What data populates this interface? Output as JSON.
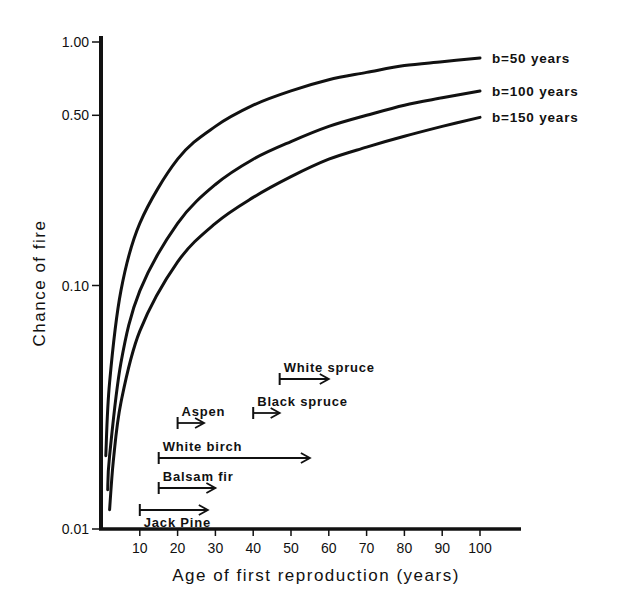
{
  "chart_data": {
    "type": "line",
    "title": "",
    "xlabel": "Age of first reproduction (years)",
    "ylabel": "Chance of fire",
    "xlim": [
      0,
      110
    ],
    "ylim": [
      0.01,
      1.0
    ],
    "yscale": "log",
    "grid": false,
    "legend_position": "inline-right",
    "x_ticks": [
      10,
      20,
      30,
      40,
      50,
      60,
      70,
      80,
      90,
      100
    ],
    "x_tick_labels": [
      "10",
      "20",
      "30",
      "40",
      "50",
      "60",
      "70",
      "80",
      "90",
      "100"
    ],
    "y_ticks": [
      0.01,
      0.1,
      0.5,
      1.0
    ],
    "y_tick_labels": [
      "0.01",
      "0.10",
      "0.50",
      "1.00"
    ],
    "series": [
      {
        "name": "b=50 years",
        "label": "b=50 years",
        "b": 50,
        "x": [
          1,
          2,
          5,
          10,
          20,
          30,
          40,
          50,
          60,
          70,
          80,
          90,
          100
        ],
        "values": [
          0.02,
          0.04,
          0.095,
          0.18,
          0.33,
          0.45,
          0.55,
          0.63,
          0.7,
          0.75,
          0.8,
          0.83,
          0.86
        ]
      },
      {
        "name": "b=100 years",
        "label": "b=100 years",
        "b": 100,
        "x": [
          1.5,
          2,
          5,
          10,
          20,
          30,
          40,
          50,
          60,
          70,
          80,
          90,
          100
        ],
        "values": [
          0.0145,
          0.02,
          0.048,
          0.095,
          0.18,
          0.26,
          0.33,
          0.39,
          0.45,
          0.5,
          0.55,
          0.59,
          0.63
        ]
      },
      {
        "name": "b=150 years",
        "label": "b=150 years",
        "b": 150,
        "x": [
          2,
          3,
          5,
          10,
          20,
          30,
          40,
          50,
          60,
          70,
          80,
          90,
          100
        ],
        "values": [
          0.012,
          0.019,
          0.033,
          0.065,
          0.125,
          0.18,
          0.23,
          0.28,
          0.33,
          0.37,
          0.41,
          0.45,
          0.49
        ]
      }
    ],
    "annotations": [
      {
        "species": "Jack Pine",
        "start_age": 10,
        "end_age": 28,
        "label_position": "below"
      },
      {
        "species": "Balsam fir",
        "start_age": 15,
        "end_age": 30,
        "label_position": "above"
      },
      {
        "species": "White birch",
        "start_age": 15,
        "end_age": 55,
        "label_position": "above"
      },
      {
        "species": "Aspen",
        "start_age": 20,
        "end_age": 27,
        "label_position": "above"
      },
      {
        "species": "Black spruce",
        "start_age": 40,
        "end_age": 47,
        "label_position": "above"
      },
      {
        "species": "White spruce",
        "start_age": 47,
        "end_age": 60,
        "label_position": "above"
      }
    ]
  },
  "axes": {
    "xlabel": "Age of first reproduction (years)",
    "ylabel": "Chance of fire"
  },
  "colors": {
    "ink": "#111111",
    "background": "#ffffff"
  }
}
